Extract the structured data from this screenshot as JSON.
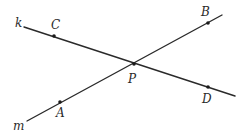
{
  "diagram": {
    "type": "intersecting-lines",
    "colors": {
      "stroke": "#2a2a2a",
      "point": "#1a1a1a",
      "background": "#ffffff"
    },
    "lines": [
      {
        "name": "k",
        "from": [
          24,
          27
        ],
        "to": [
          235,
          96
        ],
        "label_pos": [
          15,
          27
        ]
      },
      {
        "name": "m",
        "from": [
          27,
          121
        ],
        "to": [
          222,
          15
        ],
        "label_pos": [
          13,
          130
        ]
      }
    ],
    "points": [
      {
        "name": "C",
        "x": 54,
        "y": 36,
        "label_x": 51,
        "label_y": 29,
        "dot": true
      },
      {
        "name": "B",
        "x": 208,
        "y": 23,
        "label_x": 201,
        "label_y": 16,
        "dot": true
      },
      {
        "name": "P",
        "x": 134,
        "y": 64,
        "label_x": 128,
        "label_y": 83,
        "dot": true
      },
      {
        "name": "D",
        "x": 208,
        "y": 87,
        "label_x": 202,
        "label_y": 103,
        "dot": true
      },
      {
        "name": "A",
        "x": 60,
        "y": 102,
        "label_x": 56,
        "label_y": 117,
        "dot": true
      }
    ]
  }
}
